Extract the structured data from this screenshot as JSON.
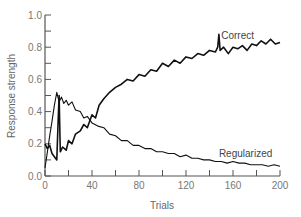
{
  "chart_data": {
    "type": "line",
    "title": "",
    "xlabel": "Trials",
    "ylabel": "Response strength",
    "xlim": [
      0,
      200
    ],
    "ylim": [
      0.0,
      1.0
    ],
    "x_ticks": [
      0,
      40,
      80,
      120,
      160,
      200
    ],
    "x_minor_ticks": [
      20,
      60,
      100,
      140,
      180
    ],
    "y_ticks": [
      "0.0",
      "0.2",
      "0.4",
      "0.6",
      "0.8",
      "1.0"
    ],
    "y_minor_ticks": [
      0.1,
      0.3,
      0.5,
      0.7,
      0.9
    ],
    "grid": false,
    "legend": "inline labels",
    "series": [
      {
        "name": "Correct",
        "label_pos": {
          "x": 150,
          "y": 0.85
        },
        "x": [
          0,
          2,
          4,
          6,
          8,
          10,
          11,
          12,
          13,
          15,
          18,
          20,
          23,
          26,
          30,
          33,
          36,
          40,
          43,
          46,
          50,
          55,
          60,
          65,
          70,
          75,
          80,
          85,
          90,
          95,
          100,
          105,
          110,
          115,
          120,
          125,
          130,
          135,
          140,
          145,
          147,
          148,
          149,
          152,
          156,
          160,
          164,
          168,
          172,
          176,
          180,
          184,
          188,
          192,
          196,
          200
        ],
        "values": [
          0.2,
          0.17,
          0.19,
          0.14,
          0.12,
          0.1,
          0.3,
          0.5,
          0.15,
          0.18,
          0.16,
          0.22,
          0.2,
          0.26,
          0.28,
          0.32,
          0.3,
          0.38,
          0.36,
          0.44,
          0.48,
          0.52,
          0.55,
          0.57,
          0.6,
          0.59,
          0.63,
          0.62,
          0.66,
          0.65,
          0.7,
          0.68,
          0.72,
          0.7,
          0.74,
          0.73,
          0.76,
          0.75,
          0.78,
          0.77,
          0.8,
          0.88,
          0.78,
          0.8,
          0.76,
          0.8,
          0.79,
          0.81,
          0.78,
          0.82,
          0.81,
          0.84,
          0.82,
          0.85,
          0.82,
          0.83
        ]
      },
      {
        "name": "Regularized",
        "label_pos": {
          "x": 148,
          "y": 0.12
        },
        "x": [
          0,
          2,
          4,
          6,
          8,
          10,
          12,
          14,
          16,
          18,
          20,
          23,
          26,
          30,
          33,
          36,
          40,
          45,
          50,
          55,
          60,
          65,
          70,
          75,
          80,
          85,
          90,
          95,
          100,
          105,
          110,
          115,
          120,
          125,
          130,
          135,
          140,
          145,
          150,
          155,
          160,
          165,
          170,
          175,
          180,
          185,
          190,
          195,
          200
        ],
        "values": [
          0.05,
          0.15,
          0.25,
          0.34,
          0.44,
          0.52,
          0.46,
          0.49,
          0.45,
          0.47,
          0.44,
          0.46,
          0.41,
          0.4,
          0.36,
          0.37,
          0.33,
          0.31,
          0.3,
          0.26,
          0.25,
          0.22,
          0.22,
          0.19,
          0.19,
          0.17,
          0.17,
          0.15,
          0.15,
          0.14,
          0.14,
          0.12,
          0.13,
          0.11,
          0.11,
          0.1,
          0.1,
          0.09,
          0.09,
          0.08,
          0.09,
          0.08,
          0.08,
          0.07,
          0.07,
          0.07,
          0.06,
          0.07,
          0.06
        ]
      }
    ]
  },
  "labels": {
    "xlabel": "Trials",
    "ylabel": "Response strength",
    "correct": "Correct",
    "regularized": "Regularized"
  }
}
